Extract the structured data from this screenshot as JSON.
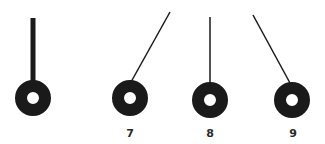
{
  "diagram": {
    "colors": {
      "ink": "#1a1a1a",
      "background": "#ffffff"
    },
    "figures": [
      {
        "id": "fig-0",
        "label": "",
        "rod": {
          "x1": 33,
          "y1": 18,
          "x2": 33,
          "y2": 82,
          "width": 5
        },
        "bob": {
          "cx": 33,
          "cy": 98,
          "r": 18,
          "hole": 6
        }
      },
      {
        "id": "fig-7",
        "label": "7",
        "rod": {
          "x1": 170,
          "y1": 12,
          "x2": 131,
          "y2": 82,
          "width": 1.5
        },
        "bob": {
          "cx": 130,
          "cy": 98,
          "r": 18,
          "hole": 6
        }
      },
      {
        "id": "fig-8",
        "label": "8",
        "rod": {
          "x1": 210,
          "y1": 17,
          "x2": 210,
          "y2": 84,
          "width": 1.5
        },
        "bob": {
          "cx": 210,
          "cy": 100,
          "r": 18,
          "hole": 6
        }
      },
      {
        "id": "fig-9",
        "label": "9",
        "rod": {
          "x1": 253,
          "y1": 15,
          "x2": 290,
          "y2": 83,
          "width": 1.5
        },
        "bob": {
          "cx": 292,
          "cy": 100,
          "r": 18,
          "hole": 6
        }
      }
    ],
    "labels": [
      {
        "text": "7",
        "x": 130,
        "y": 137
      },
      {
        "text": "8",
        "x": 210,
        "y": 137
      },
      {
        "text": "9",
        "x": 293,
        "y": 137
      }
    ]
  }
}
